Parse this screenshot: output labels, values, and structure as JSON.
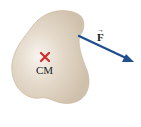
{
  "diagram": {
    "body_label": "CM",
    "force_label": "F",
    "force_vector_mark": "→",
    "colors": {
      "body_fill": "#d8cbb9",
      "body_center": "#f6f1ea",
      "cm_marker": "#d42a2a",
      "force_arrow": "#1f4f8f"
    }
  }
}
